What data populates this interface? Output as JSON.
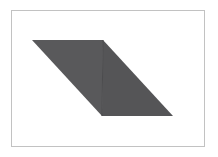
{
  "figure": {
    "canvas": {
      "width": 218,
      "height": 157,
      "background_color": "#ffffff"
    },
    "frame": {
      "name": "figure-border",
      "x": 11,
      "y": 10,
      "width": 194,
      "height": 137,
      "border_color": "#c2c2c2",
      "border_width": 1,
      "fill_color": "#ffffff"
    },
    "shape": {
      "kind": "parallelogram",
      "vertices": [
        {
          "label": "A",
          "x": 32,
          "y": 40
        },
        {
          "label": "B",
          "x": 103,
          "y": 40
        },
        {
          "label": "C",
          "x": 173,
          "y": 116
        },
        {
          "label": "D",
          "x": 102,
          "y": 116
        }
      ],
      "divider": {
        "name": "vertical-divider",
        "x1": 103,
        "y1": 40,
        "x2": 102,
        "y2": 116,
        "color": "#4c4c4e"
      },
      "faces": [
        {
          "name": "left-triangle",
          "points": "32,40 103,40 102,116",
          "fill_color": "#59595b"
        },
        {
          "name": "right-triangle",
          "points": "103,40 173,116 102,116",
          "fill_color": "#555557"
        }
      ]
    },
    "colors": {
      "shape_fill": "#59595b",
      "shape_fill_alt": "#555557",
      "frame_border": "#c2c2c2",
      "background": "#ffffff"
    }
  }
}
